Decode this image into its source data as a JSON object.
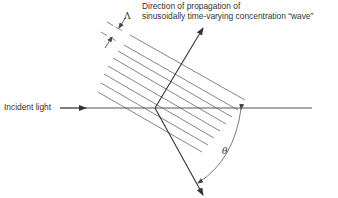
{
  "diagram": {
    "title_lines": [
      "Direction of propagation of",
      "sinusoidally time-varying concentration “wave”"
    ],
    "incident_label": "Incident light",
    "spacing_symbol": "Λ",
    "angle_symbol": "θ",
    "colors": {
      "line": "#444444",
      "hatch": "#777777",
      "text": "#333333"
    },
    "elements": {
      "incident_ray": {
        "from": [
          60,
          108
        ],
        "to": [
          312,
          108
        ],
        "arrow_at": [
          84,
          108
        ]
      },
      "vertex": [
        155,
        108
      ],
      "propagation_arrow": {
        "from": [
          155,
          108
        ],
        "to": [
          203,
          27
        ]
      },
      "diffracted_arrow": {
        "from": [
          155,
          108
        ],
        "to": [
          203,
          195
        ]
      },
      "hatch_count": 8,
      "hatch_dashed_count": 2,
      "angle_arc": {
        "from": [
          240,
          109
        ],
        "to": [
          198,
          183
        ],
        "label_pos": [
          225,
          152
        ]
      }
    }
  }
}
